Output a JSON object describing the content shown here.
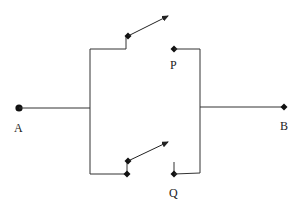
{
  "diagram": {
    "type": "circuit",
    "terminals": [
      {
        "id": "A",
        "label": "A"
      },
      {
        "id": "B",
        "label": "B"
      }
    ],
    "switches": [
      {
        "id": "P",
        "label": "P",
        "branch": "upper",
        "state": "open"
      },
      {
        "id": "Q",
        "label": "Q",
        "branch": "lower",
        "state": "open"
      }
    ],
    "colors": {
      "line": "#333333",
      "node": "#111111",
      "background": "#ffffff"
    }
  }
}
